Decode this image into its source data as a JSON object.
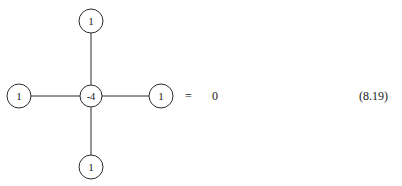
{
  "figure": {
    "kind": "five-point-stencil-diagram",
    "background_color": "#ffffff",
    "stroke_color": "#2b2b2b",
    "text_color": "#1a1a1a",
    "nodes": [
      {
        "id": "top",
        "label": "1",
        "cx": 91,
        "cy": 21,
        "r": 12
      },
      {
        "id": "left",
        "label": "1",
        "cx": 19,
        "cy": 96,
        "r": 12
      },
      {
        "id": "center",
        "label": "-4",
        "cx": 91,
        "cy": 96,
        "r": 11
      },
      {
        "id": "right",
        "label": "1",
        "cx": 161,
        "cy": 96,
        "r": 12
      },
      {
        "id": "bottom",
        "label": "1",
        "cx": 91,
        "cy": 167,
        "r": 12
      }
    ],
    "edges": [
      {
        "id": "edge-center-top",
        "x1": 91,
        "y1": 85,
        "x2": 91,
        "y2": 33
      },
      {
        "id": "edge-center-left",
        "x1": 80,
        "y1": 96,
        "x2": 31,
        "y2": 96
      },
      {
        "id": "edge-center-right",
        "x1": 102,
        "y1": 96,
        "x2": 149,
        "y2": 96
      },
      {
        "id": "edge-center-bottom",
        "x1": 91,
        "y1": 107,
        "x2": 91,
        "y2": 155
      }
    ]
  },
  "equation": {
    "equals_sign": "=",
    "rhs_value": "0",
    "number": "(8.19)"
  }
}
